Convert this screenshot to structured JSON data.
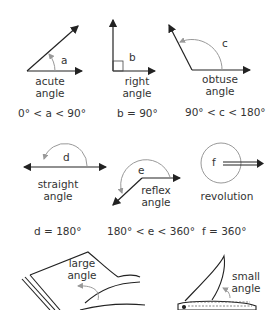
{
  "angles": [
    {
      "id": "acute",
      "variable": "a",
      "label_line1": "acute",
      "label_line2": "angle",
      "condition": "0° < a < 90°"
    },
    {
      "id": "right",
      "variable": "b",
      "label_line1": "right",
      "label_line2": "angle",
      "condition": "b = 90°"
    },
    {
      "id": "obtuse",
      "variable": "c",
      "label_line1": "obtuse",
      "label_line2": "angle",
      "condition": "90° < c < 180°"
    },
    {
      "id": "straight",
      "variable": "d",
      "label_line1": "straight",
      "label_line2": "angle",
      "condition": "d = 180°"
    },
    {
      "id": "reflex",
      "variable": "e",
      "label_line1": "reflex",
      "label_line2": "angle",
      "condition": "180° < e < 360°"
    },
    {
      "id": "revolution",
      "variable": "f",
      "label_line1": "revolution",
      "label_line2": "",
      "condition": "f = 360°"
    }
  ],
  "examples": [
    {
      "id": "book",
      "label_line1": "large",
      "label_line2": "angle"
    },
    {
      "id": "knife",
      "label_line1": "small",
      "label_line2": "angle"
    }
  ],
  "colors": {
    "line": "#222222",
    "arc": "#999999"
  }
}
